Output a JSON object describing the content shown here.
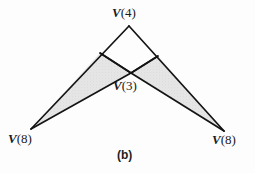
{
  "figure": {
    "caption": "(b)",
    "background_color": "#fdfdfd",
    "stroke_color": "#141414",
    "shade_color": "#e3e3e3",
    "labels": [
      {
        "name": "apex",
        "prefix": "V",
        "value": "(4)",
        "text": "V(4)",
        "x": 112,
        "y": 6
      },
      {
        "name": "center",
        "prefix": "V",
        "value": "(3)",
        "text": "V(3)",
        "x": 113,
        "y": 79
      },
      {
        "name": "bottom-left",
        "prefix": "V",
        "value": "(8)",
        "text": "V(8)",
        "x": 8,
        "y": 132
      },
      {
        "name": "bottom-right",
        "prefix": "V",
        "value": "(8)",
        "text": "V(8)",
        "x": 212,
        "y": 133
      }
    ],
    "points": {
      "apex": {
        "x": 129,
        "y": 26
      },
      "center": {
        "x": 131,
        "y": 73
      },
      "left_junction": {
        "x": 100,
        "y": 53
      },
      "right_junction": {
        "x": 158,
        "y": 56
      },
      "bottom_left": {
        "x": 31,
        "y": 129
      },
      "bottom_right": {
        "x": 224,
        "y": 131
      }
    },
    "shaded_regions": [
      {
        "name": "left-shaded-triangle",
        "points": "31,129 100,53 131,73"
      },
      {
        "name": "right-shaded-triangle",
        "points": "131,73 158,56 224,131"
      }
    ],
    "edges": [
      {
        "name": "apex-to-bottom-left",
        "from": "apex",
        "to": "bottom_left"
      },
      {
        "name": "apex-to-bottom-right",
        "from": "apex",
        "to": "bottom_right"
      },
      {
        "name": "left-junction-to-center",
        "from": "left_junction",
        "to": "center"
      },
      {
        "name": "right-junction-to-center",
        "from": "right_junction",
        "to": "center"
      },
      {
        "name": "center-to-bottom-left",
        "from": "center",
        "to": "bottom_left"
      },
      {
        "name": "center-to-bottom-right",
        "from": "center",
        "to": "bottom_right"
      }
    ]
  }
}
